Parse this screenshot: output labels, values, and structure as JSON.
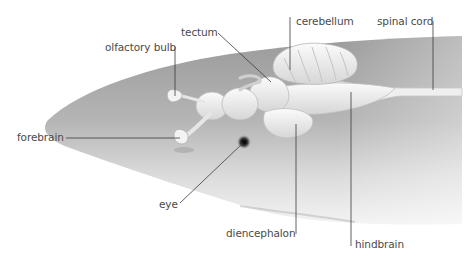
{
  "diagram": {
    "colors": {
      "background": "#ffffff",
      "body_dark": "#8c8c8c",
      "body_light": "#f2f2f2",
      "brain": "#f4f4f4",
      "leader_line": "#3a3a3a",
      "label_text": "#4a4a4a"
    },
    "labels": [
      {
        "id": "tectum",
        "text": "tectum",
        "x": 181,
        "y": 26
      },
      {
        "id": "olfactory-bulb",
        "text": "olfactory bulb",
        "x": 105,
        "y": 41
      },
      {
        "id": "cerebellum",
        "text": "cerebellum",
        "x": 296,
        "y": 15
      },
      {
        "id": "spinal-cord",
        "text": "spinal cord",
        "x": 377,
        "y": 15
      },
      {
        "id": "forebrain",
        "text": "forebrain",
        "x": 17,
        "y": 131
      },
      {
        "id": "eye",
        "text": "eye",
        "x": 159,
        "y": 198
      },
      {
        "id": "diencephalon",
        "text": "diencephalon",
        "x": 226,
        "y": 227
      },
      {
        "id": "hindbrain",
        "text": "hindbrain",
        "x": 355,
        "y": 238
      }
    ]
  }
}
